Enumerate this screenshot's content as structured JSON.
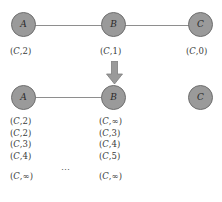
{
  "figure": {
    "colors": {
      "node_fill": "#9a9a9a",
      "node_stroke": "#6f6f6f",
      "edge": "#8e8e8e",
      "arrow": "#9a9a9a",
      "text": "#3a3a3a"
    }
  },
  "before": {
    "nodes": [
      {
        "id": "A",
        "label": "A",
        "caption_prefix": "(",
        "caption_dest": "C",
        "caption_sep": ",",
        "caption_cost": "2",
        "caption_suffix": ")"
      },
      {
        "id": "B",
        "label": "B",
        "caption_prefix": "(",
        "caption_dest": "C",
        "caption_sep": ",",
        "caption_cost": "1",
        "caption_suffix": ")"
      },
      {
        "id": "C",
        "label": "C",
        "caption_prefix": "(",
        "caption_dest": "C",
        "caption_sep": ",",
        "caption_cost": "0",
        "caption_suffix": ")"
      }
    ],
    "edges": [
      {
        "from": "A",
        "to": "B"
      },
      {
        "from": "B",
        "to": "C"
      }
    ]
  },
  "transition": {
    "arrow_icon": "down-arrow-icon"
  },
  "after": {
    "nodes": [
      {
        "id": "A",
        "label": "A"
      },
      {
        "id": "B",
        "label": "B"
      },
      {
        "id": "C",
        "label": "C"
      }
    ],
    "edges": [
      {
        "from": "A",
        "to": "B"
      }
    ],
    "columns": [
      {
        "node": "A",
        "entries": [
          {
            "prefix": "(",
            "dest": "C",
            "sep": ",",
            "cost": "2",
            "suffix": ")"
          },
          {
            "prefix": "(",
            "dest": "C",
            "sep": ",",
            "cost": "2",
            "suffix": ")"
          },
          {
            "prefix": "(",
            "dest": "C",
            "sep": ",",
            "cost": "3",
            "suffix": ")"
          },
          {
            "prefix": "(",
            "dest": "C",
            "sep": ",",
            "cost": "4",
            "suffix": ")"
          }
        ],
        "final": {
          "prefix": "(",
          "dest": "C",
          "sep": ",",
          "cost": "∞",
          "suffix": ")"
        }
      },
      {
        "node": "B",
        "entries": [
          {
            "prefix": "(",
            "dest": "C",
            "sep": ",",
            "cost": "∞",
            "suffix": ")"
          },
          {
            "prefix": "(",
            "dest": "C",
            "sep": ",",
            "cost": "3",
            "suffix": ")"
          },
          {
            "prefix": "(",
            "dest": "C",
            "sep": ",",
            "cost": "4",
            "suffix": ")"
          },
          {
            "prefix": "(",
            "dest": "C",
            "sep": ",",
            "cost": "5",
            "suffix": ")"
          }
        ],
        "final": {
          "prefix": "(",
          "dest": "C",
          "sep": ",",
          "cost": "∞",
          "suffix": ")"
        }
      }
    ],
    "ellipsis": "⋯"
  }
}
